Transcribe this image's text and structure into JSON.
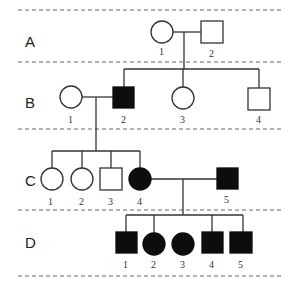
{
  "diagram": {
    "type": "pedigree",
    "generations": [
      {
        "label": "A",
        "individuals": [
          {
            "id": "1",
            "sex": "female",
            "affected": false
          },
          {
            "id": "2",
            "sex": "male",
            "affected": false
          }
        ]
      },
      {
        "label": "B",
        "individuals": [
          {
            "id": "1",
            "sex": "female",
            "affected": false
          },
          {
            "id": "2",
            "sex": "male",
            "affected": true
          },
          {
            "id": "3",
            "sex": "female",
            "affected": false
          },
          {
            "id": "4",
            "sex": "male",
            "affected": false
          }
        ]
      },
      {
        "label": "C",
        "individuals": [
          {
            "id": "1",
            "sex": "female",
            "affected": false
          },
          {
            "id": "2",
            "sex": "female",
            "affected": false
          },
          {
            "id": "3",
            "sex": "male",
            "affected": false
          },
          {
            "id": "4",
            "sex": "female",
            "affected": true
          },
          {
            "id": "5",
            "sex": "male",
            "affected": true
          }
        ]
      },
      {
        "label": "D",
        "individuals": [
          {
            "id": "1",
            "sex": "male",
            "affected": true
          },
          {
            "id": "2",
            "sex": "female",
            "affected": true
          },
          {
            "id": "3",
            "sex": "female",
            "affected": true
          },
          {
            "id": "4",
            "sex": "male",
            "affected": true
          },
          {
            "id": "5",
            "sex": "male",
            "affected": true
          }
        ]
      }
    ],
    "couples": [
      {
        "generation": "A",
        "partners": [
          "A1",
          "A2"
        ],
        "children": [
          "B2",
          "B3",
          "B4"
        ]
      },
      {
        "generation": "B",
        "partners": [
          "B1",
          "B2"
        ],
        "children": [
          "C1",
          "C2",
          "C3",
          "C4"
        ]
      },
      {
        "generation": "C",
        "partners": [
          "C4",
          "C5"
        ],
        "children": [
          "D1",
          "D2",
          "D3",
          "D4",
          "D5"
        ]
      }
    ],
    "colors": {
      "affected": "#0d0d0d",
      "unaffected": "#ffffff",
      "line": "#333333"
    }
  }
}
